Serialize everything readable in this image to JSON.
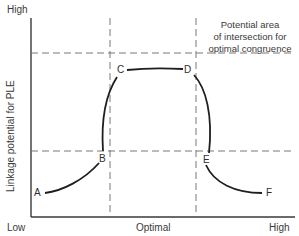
{
  "diagram": {
    "y_axis": {
      "title": "Linkage potential for PLE",
      "top_label": "High",
      "bottom_label": "Low"
    },
    "x_axis": {
      "left_label": "Low",
      "center_label": "Optimal",
      "right_label": "High"
    },
    "annotation": {
      "line1": "Potential area",
      "line2": "of intersection for",
      "line3": "optimal congruence"
    },
    "points": {
      "A": "A",
      "B": "B",
      "C": "C",
      "D": "D",
      "E": "E",
      "F": "F"
    },
    "colors": {
      "curve": "#1e1e1e",
      "axis": "#3a3a3a",
      "dashed": "#6a6a6a",
      "text": "#3a3a3a"
    }
  }
}
